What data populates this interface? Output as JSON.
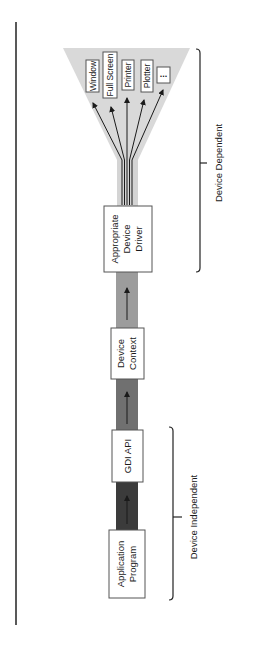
{
  "diagram": {
    "type": "flow",
    "orientation": "rotated-90-ccw",
    "stages": [
      {
        "id": "app",
        "lines": [
          "Application",
          "Program"
        ]
      },
      {
        "id": "gdi",
        "lines": [
          "GDI  API"
        ]
      },
      {
        "id": "dc",
        "lines": [
          "Device",
          "Context"
        ]
      },
      {
        "id": "driver",
        "lines": [
          "Appropriate",
          "Device",
          "Driver"
        ]
      }
    ],
    "outputs": [
      "Window",
      "Full  Screen",
      "Printer",
      "Plotter",
      "..."
    ],
    "brackets": {
      "independent": "Device  Independent",
      "dependent": "Device  Dependent"
    },
    "colors": {
      "bar_dark": "#3b3b3b",
      "bar_mid": "#707070",
      "bar_light": "#9c9c9c",
      "funnel": "#d9d9d9",
      "stem": "#d4d4d4"
    }
  }
}
